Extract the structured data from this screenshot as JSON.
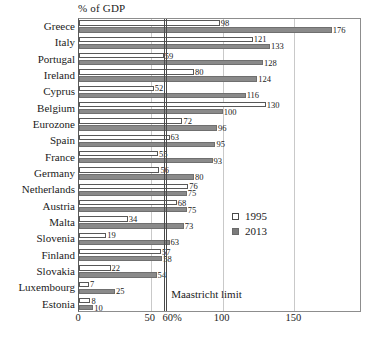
{
  "chart_data": {
    "type": "bar",
    "orientation": "horizontal",
    "title": "% of GDP",
    "xlabel": "",
    "ylabel": "",
    "xlim": [
      0,
      197
    ],
    "grid": true,
    "xticks": [
      "0",
      "50",
      "60%",
      "100",
      "150"
    ],
    "xtick_values": [
      0,
      50,
      60,
      100,
      150
    ],
    "legend_position": "center-right",
    "categories": [
      "Greece",
      "Italy",
      "Portugal",
      "Ireland",
      "Cyprus",
      "Belgium",
      "Eurozone",
      "Spain",
      "France",
      "Germany",
      "Netherlands",
      "Austria",
      "Malta",
      "Slovenia",
      "Finland",
      "Slovakia",
      "Luxembourg",
      "Estonia"
    ],
    "series": [
      {
        "name": "1995",
        "color": "#ffffff",
        "values": [
          98,
          121,
          59,
          80,
          52,
          130,
          72,
          63,
          55,
          56,
          76,
          68,
          34,
          19,
          57,
          22,
          7,
          8
        ]
      },
      {
        "name": "2013",
        "color": "#8a8a8a",
        "values": [
          176,
          133,
          128,
          124,
          116,
          100,
          96,
          95,
          93,
          80,
          75,
          75,
          73,
          63,
          58,
          54,
          25,
          10
        ]
      }
    ],
    "annotations": [
      {
        "label": "Maastricht limit",
        "value": 60,
        "type": "vline"
      }
    ]
  }
}
